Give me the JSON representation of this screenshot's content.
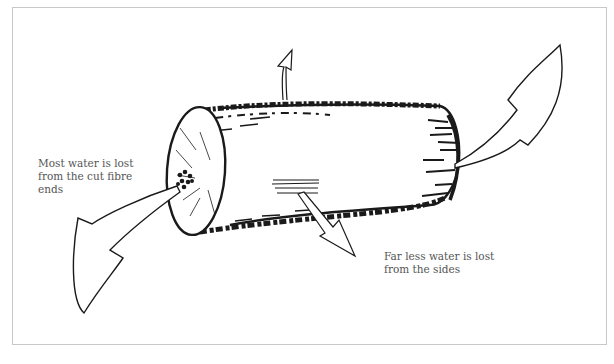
{
  "diagram": {
    "labels": {
      "ends": "Most water is lost\nfrom the cut fibre\nends",
      "sides": "Far less water is lost\nfrom the sides"
    },
    "arrows": [
      {
        "name": "large-arrow-left-end",
        "meaning": "water lost from cut fibre ends (left)"
      },
      {
        "name": "large-arrow-right-end",
        "meaning": "water lost from cut fibre ends (right)"
      },
      {
        "name": "small-arrow-top-side",
        "meaning": "water lost from sides"
      },
      {
        "name": "small-arrow-bottom-side",
        "meaning": "water lost from sides"
      }
    ],
    "colors": {
      "ink": "#1a1a1a",
      "frame": "#c8c8c8",
      "label_text": "#555555"
    }
  }
}
